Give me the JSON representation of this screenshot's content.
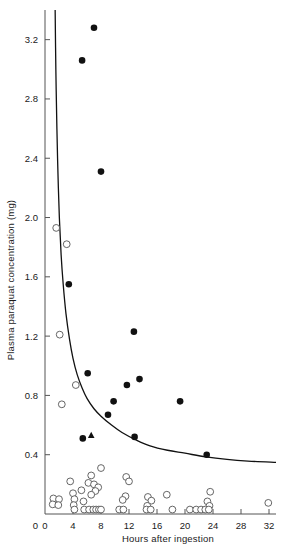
{
  "chart_data": {
    "type": "scatter",
    "title": "",
    "xlabel": "Hours after ingestion",
    "ylabel": "Plasma paraquat concentration (mg)",
    "xlim": [
      0,
      33
    ],
    "ylim": [
      0,
      3.4
    ],
    "xticks": [
      0,
      4,
      8,
      12,
      16,
      20,
      24,
      28,
      32
    ],
    "xtick_labels": [
      "0",
      "4",
      "8",
      "12",
      "16",
      "20",
      "24",
      "28",
      "32"
    ],
    "yticks": [
      0,
      0.4,
      0.8,
      1.2,
      1.6,
      2.0,
      2.4,
      2.8,
      3.2
    ],
    "ytick_labels": [
      "0",
      "0.4",
      "0.8",
      "1.2",
      "1.6",
      "2.0",
      "2.4",
      "2.8",
      "3.2"
    ],
    "grid": false,
    "legend": null,
    "series": [
      {
        "name": "died",
        "marker": "filled-circle",
        "color": "#111111",
        "points": [
          [
            7.0,
            3.28
          ],
          [
            5.3,
            3.06
          ],
          [
            8.0,
            2.31
          ],
          [
            3.4,
            1.55
          ],
          [
            12.7,
            1.23
          ],
          [
            6.1,
            0.95
          ],
          [
            13.5,
            0.91
          ],
          [
            11.7,
            0.87
          ],
          [
            9.8,
            0.76
          ],
          [
            19.3,
            0.76
          ],
          [
            9.0,
            0.67
          ],
          [
            5.4,
            0.51
          ],
          [
            12.8,
            0.52
          ],
          [
            23.1,
            0.4
          ]
        ]
      },
      {
        "name": "survived",
        "marker": "open-circle",
        "color": "#555555",
        "points": [
          [
            1.6,
            1.93
          ],
          [
            3.1,
            1.82
          ],
          [
            2.1,
            1.21
          ],
          [
            4.4,
            0.87
          ],
          [
            2.4,
            0.74
          ],
          [
            8.0,
            0.31
          ],
          [
            6.6,
            0.26
          ],
          [
            11.6,
            0.25
          ],
          [
            3.6,
            0.22
          ],
          [
            12.0,
            0.22
          ],
          [
            6.2,
            0.21
          ],
          [
            7.0,
            0.2
          ],
          [
            7.6,
            0.18
          ],
          [
            5.2,
            0.16
          ],
          [
            7.2,
            0.155
          ],
          [
            23.6,
            0.15
          ],
          [
            4.0,
            0.14
          ],
          [
            6.6,
            0.13
          ],
          [
            17.4,
            0.13
          ],
          [
            11.5,
            0.12
          ],
          [
            14.7,
            0.115
          ],
          [
            1.2,
            0.105
          ],
          [
            2.0,
            0.1
          ],
          [
            4.2,
            0.1
          ],
          [
            11.1,
            0.095
          ],
          [
            15.2,
            0.09
          ],
          [
            5.5,
            0.085
          ],
          [
            23.2,
            0.085
          ],
          [
            1.1,
            0.065
          ],
          [
            1.9,
            0.06
          ],
          [
            4.1,
            0.06
          ],
          [
            14.6,
            0.055
          ],
          [
            23.5,
            0.055
          ],
          [
            31.9,
            0.075
          ],
          [
            4.2,
            0.03
          ],
          [
            5.6,
            0.03
          ],
          [
            6.3,
            0.03
          ],
          [
            6.9,
            0.03
          ],
          [
            7.3,
            0.03
          ],
          [
            7.7,
            0.03
          ],
          [
            8.0,
            0.03
          ],
          [
            10.6,
            0.03
          ],
          [
            11.2,
            0.03
          ],
          [
            14.5,
            0.03
          ],
          [
            15.1,
            0.03
          ],
          [
            18.2,
            0.03
          ],
          [
            20.7,
            0.03
          ],
          [
            21.6,
            0.03
          ],
          [
            22.3,
            0.03
          ],
          [
            22.9,
            0.03
          ],
          [
            23.4,
            0.03
          ]
        ]
      },
      {
        "name": "special-case",
        "marker": "filled-triangle",
        "color": "#111111",
        "points": [
          [
            6.6,
            0.53
          ]
        ]
      }
    ],
    "curve": {
      "name": "prognosis-line",
      "description": "decaying prognostic threshold curve",
      "points": [
        [
          1.45,
          3.4
        ],
        [
          1.55,
          3.0
        ],
        [
          1.7,
          2.6
        ],
        [
          1.85,
          2.3
        ],
        [
          2.05,
          2.0
        ],
        [
          2.3,
          1.75
        ],
        [
          2.6,
          1.55
        ],
        [
          3.0,
          1.35
        ],
        [
          3.5,
          1.18
        ],
        [
          4.0,
          1.05
        ],
        [
          4.6,
          0.94
        ],
        [
          5.3,
          0.85
        ],
        [
          6.0,
          0.78
        ],
        [
          7.0,
          0.71
        ],
        [
          8.0,
          0.66
        ],
        [
          9.5,
          0.6
        ],
        [
          11.0,
          0.55
        ],
        [
          13.0,
          0.5
        ],
        [
          15.0,
          0.46
        ],
        [
          17.5,
          0.43
        ],
        [
          20.0,
          0.41
        ],
        [
          23.0,
          0.385
        ],
        [
          26.0,
          0.368
        ],
        [
          29.0,
          0.357
        ],
        [
          33.0,
          0.348
        ]
      ]
    }
  }
}
